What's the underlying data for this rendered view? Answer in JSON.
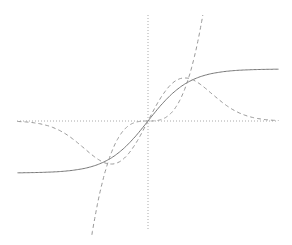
{
  "chart_data": {
    "type": "line",
    "title": "",
    "xlabel": "",
    "ylabel": "",
    "xlim": [
      -3,
      3
    ],
    "ylim": [
      -2.5,
      2.45
    ],
    "grid": false,
    "legend": null,
    "axes": {
      "style": "dotted",
      "through_origin": true,
      "color": "#999999"
    },
    "series": [
      {
        "name": "sigmoid (tanh-like)",
        "style": "solid",
        "color": "#777777",
        "x": [
          -3,
          -2.5,
          -2,
          -1.5,
          -1,
          -0.5,
          0,
          0.5,
          1,
          1.5,
          2,
          2.5,
          3
        ],
        "y": [
          -1.0,
          -0.99,
          -0.96,
          -0.9,
          -0.76,
          -0.46,
          0,
          0.46,
          0.76,
          0.9,
          0.96,
          0.99,
          1.0
        ]
      },
      {
        "name": "wave (x·exp(-x²)-like)",
        "style": "dashed",
        "color": "#999999",
        "x": [
          -3,
          -2.5,
          -2,
          -1.5,
          -1,
          -0.85,
          -0.5,
          0,
          0.5,
          0.85,
          1,
          1.5,
          2,
          2.5,
          3
        ],
        "y": [
          -0.04,
          -0.1,
          -0.25,
          -0.45,
          -0.6,
          -0.62,
          -0.48,
          0,
          0.48,
          0.62,
          0.6,
          0.45,
          0.25,
          0.1,
          0.04
        ]
      },
      {
        "name": "cubic",
        "style": "dashed",
        "color": "#999999",
        "x": [
          -1.29,
          -1,
          -0.5,
          0,
          0.5,
          1,
          1.26
        ],
        "y": [
          -2.1,
          -1.0,
          -0.125,
          0,
          0.125,
          1.0,
          2.0
        ]
      }
    ]
  }
}
